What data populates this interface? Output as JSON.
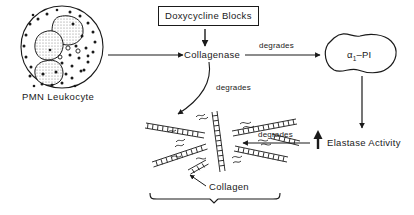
{
  "diagram": {
    "nodes": {
      "leukocyte_label": "PMN Leukocyte",
      "doxycycline_box": "Doxycycline  Blocks",
      "collagenase": "Collagenase",
      "alpha1_pi_main": "α",
      "alpha1_pi_sub": "1",
      "alpha1_pi_tail": "–PI",
      "elastase": "Elastase Activity",
      "elastase_arrow_glyph": "↑",
      "collagen": "Collagen"
    },
    "edge_labels": {
      "degrades_to_pi": "degrades",
      "degrades_to_collagen_curve": "degrades",
      "degrades_from_elastase": "degrades"
    },
    "colors": {
      "ink": "#1a1a1a",
      "background": "#ffffff",
      "nucleus_fill": "#b9b9b9"
    }
  }
}
